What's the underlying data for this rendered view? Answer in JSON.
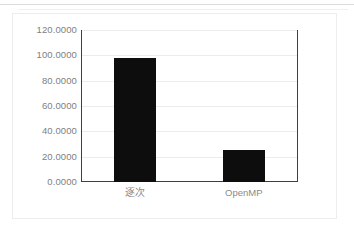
{
  "chart_data": {
    "type": "bar",
    "title": "",
    "xlabel": "",
    "ylabel": "",
    "categories": [
      "逐次",
      "OpenMP"
    ],
    "values": [
      98.0,
      25.5
    ],
    "ylim": [
      0,
      120
    ],
    "yticks": [
      0,
      20,
      40,
      60,
      80,
      100,
      120
    ],
    "ytick_labels": [
      "0.0000",
      "20.0000",
      "40.0000",
      "60.0000",
      "80.0000",
      "100.0000",
      "120.0000"
    ],
    "grid": true,
    "legend": "none",
    "series": [
      {
        "name": "",
        "values": [
          98.0,
          25.5
        ],
        "color": "#0d0d0d"
      }
    ]
  },
  "colors": {
    "bar": "#0d0d0d",
    "plot_border": "#3f3f3f",
    "gridline": "#ececec",
    "tick_text": "#808080",
    "category_text": "#8a8a8a",
    "card_border": "#ededed",
    "page_background": "#ffffff"
  }
}
